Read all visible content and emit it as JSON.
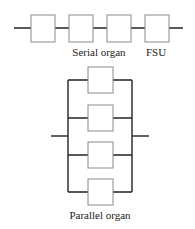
{
  "diagram": {
    "serial": {
      "label": "Serial organ",
      "fsu_label": "FSU",
      "unit_count": 4
    },
    "parallel": {
      "label": "Parallel organ",
      "unit_count": 4
    },
    "colors": {
      "line": "#222222",
      "box_border": "#8a8a8a",
      "background": "#ffffff"
    }
  }
}
